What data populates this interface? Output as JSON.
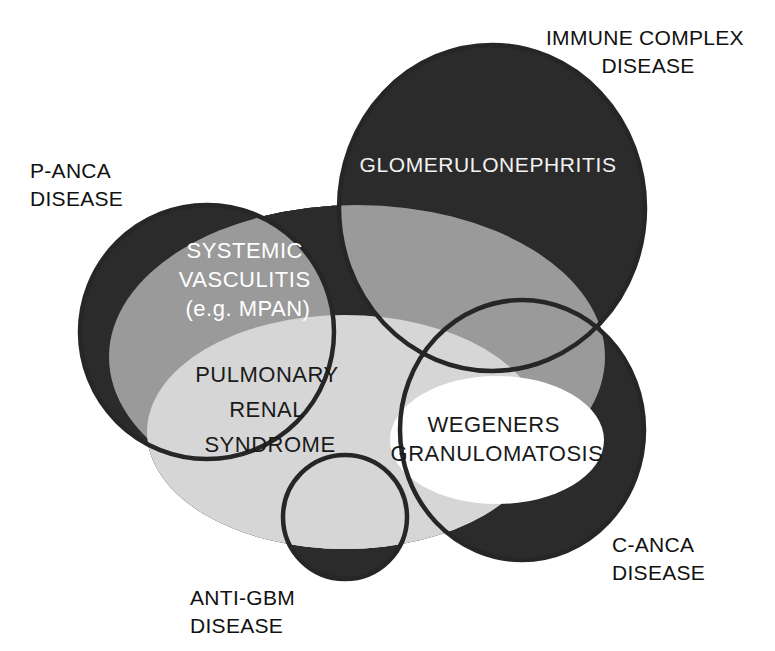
{
  "diagram": {
    "background_color": "#ffffff",
    "palette": {
      "dark": "#2b2b2b",
      "mid_gray": "#9a9a9a",
      "light_gray": "#d6d6d6",
      "white": "#ffffff",
      "outline": "#262626",
      "text_dark": "#111111",
      "text_light": "#ffffff"
    },
    "outer_labels": [
      {
        "id": "immune-complex-disease",
        "lines": [
          "IMMUNE COMPLEX",
          "DISEASE"
        ],
        "x": 648,
        "y": 45,
        "anchor": "middle"
      },
      {
        "id": "p-anca-disease",
        "lines": [
          "P-ANCA",
          "DISEASE"
        ],
        "x": 30,
        "y": 178,
        "anchor": "start"
      },
      {
        "id": "c-anca-disease",
        "lines": [
          "C-ANCA",
          "DISEASE"
        ],
        "x": 612,
        "y": 552,
        "anchor": "start"
      },
      {
        "id": "anti-gbm-disease",
        "lines": [
          "ANTI-GBM",
          "DISEASE"
        ],
        "x": 190,
        "y": 605,
        "anchor": "start"
      }
    ],
    "inner_labels": [
      {
        "id": "glomerulonephritis",
        "lines": [
          "GLOMERULONEPHRITIS"
        ],
        "x": 488,
        "y": 172,
        "anchor": "middle",
        "color": "#f2f2f2"
      },
      {
        "id": "systemic-vasculitis",
        "lines": [
          "SYSTEMIC",
          "VASCULITIS",
          "(e.g. MPAN)"
        ],
        "x": 248,
        "y": 258,
        "anchor": "middle",
        "color": "#ffffff"
      },
      {
        "id": "pulmonary-renal-syndrome",
        "lines": [
          "PULMONARY",
          "RENAL",
          "SYNDROME"
        ],
        "x": 270,
        "y": 382,
        "anchor": "middle",
        "color": "#1a1a1a"
      },
      {
        "id": "wegeners-granulomatosis",
        "lines": [
          "WEGENERS",
          "GRANULOMATOSIS"
        ],
        "x": 497,
        "y": 432,
        "anchor": "middle",
        "color": "#1a1a1a"
      }
    ],
    "shapes": [
      {
        "id": "p-anca-circle",
        "name": "P-ANCA disease set",
        "type": "circle",
        "cx": 207,
        "cy": 332,
        "r": 127,
        "fill": "#2b2b2b",
        "stroke": "#262626"
      },
      {
        "id": "immune-complex-circle",
        "name": "Immune complex disease set",
        "type": "ellipse",
        "cx": 492,
        "cy": 208,
        "rx": 153,
        "ry": 163,
        "fill": "#2b2b2b",
        "stroke": "#262626"
      },
      {
        "id": "c-anca-circle",
        "name": "C-ANCA disease set",
        "type": "ellipse",
        "cx": 522,
        "cy": 430,
        "rx": 122,
        "ry": 130,
        "fill": "#2b2b2b",
        "stroke": "#262626"
      },
      {
        "id": "anti-gbm-circle",
        "name": "Anti-GBM disease set",
        "type": "circle",
        "cx": 345,
        "cy": 517,
        "r": 62,
        "fill": "#2b2b2b",
        "stroke": "#262626"
      },
      {
        "id": "systemic-vasculitis-ellipse",
        "name": "Systemic vasculitis set",
        "type": "ellipse",
        "cx": 357,
        "cy": 357,
        "rx": 248,
        "ry": 152,
        "fill": "#9a9a9a",
        "stroke": "none"
      },
      {
        "id": "pulmonary-renal-ellipse",
        "name": "Pulmonary renal syndrome set",
        "type": "ellipse",
        "cx": 345,
        "cy": 432,
        "rx": 198,
        "ry": 117,
        "fill": "#d6d6d6",
        "stroke": "none"
      },
      {
        "id": "wegeners-ellipse",
        "name": "Wegeners granulomatosis set",
        "type": "ellipse",
        "cx": 497,
        "cy": 440,
        "rx": 107,
        "ry": 64,
        "fill": "#ffffff",
        "stroke": "none"
      }
    ]
  }
}
